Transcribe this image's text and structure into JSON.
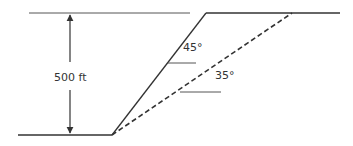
{
  "diagram": {
    "type": "slope-cross-section",
    "height_label": "500 ft",
    "steep_slope_angle": "45°",
    "shallow_slope_angle": "35°",
    "colors": {
      "line": "#333333",
      "background": "#ffffff"
    },
    "elements": [
      {
        "name": "top-ground-left",
        "style": "solid"
      },
      {
        "name": "top-ground-right",
        "style": "solid"
      },
      {
        "name": "bottom-ground",
        "style": "solid"
      },
      {
        "name": "slope-45",
        "style": "solid"
      },
      {
        "name": "slope-35",
        "style": "dashed"
      },
      {
        "name": "height-dimension-arrow",
        "style": "double-arrow"
      }
    ]
  }
}
